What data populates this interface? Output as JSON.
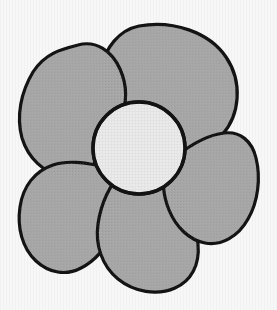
{
  "image": {
    "title": "Five-petal flower line drawing",
    "subject": "flower",
    "style": "hand-drawn black outline with flat gray fill",
    "width": 277,
    "height": 310,
    "background_color": "#f7f7f7",
    "outline_color": "#131313",
    "petal_fill_color": "#a6a6a6",
    "center_fill_color": "#ebebeb"
  },
  "flower": {
    "petal_count": 5,
    "bounds": {
      "left": 18,
      "top": 23,
      "right": 258,
      "bottom": 292
    },
    "center": {
      "name": "flower-center-disc",
      "cx": 139,
      "cy": 148,
      "r": 46,
      "fill": "#ebebeb",
      "texture": "fine-grid"
    },
    "petals": [
      {
        "name": "petal-top",
        "position": "top",
        "fill": "#a6a6a6",
        "path": "M 139 26 C 173 20 209 32 226 57 C 243 82 240 115 222 135 C 206 153 181 160 162 155 C 150 152 143 143 140 132 C 137 119 129 110 115 104 C 102 98 98 84 101 69 C 105 48 119 30 139 26 Z"
      },
      {
        "name": "petal-upper-left",
        "position": "upper-left",
        "fill": "#a6a6a6",
        "path": "M 78 45 C 96 40 112 51 120 69 C 128 87 127 104 120 120 C 113 136 104 150 96 161 C 88 172 76 178 62 176 C 44 173 28 158 22 138 C 16 116 21 92 33 72 C 45 53 62 49 78 45 Z"
      },
      {
        "name": "petal-lower-left",
        "position": "lower-left",
        "fill": "#a6a6a6",
        "path": "M 96 165 C 108 166 116 174 119 186 C 123 200 121 216 114 231 C 106 248 95 261 81 268 C 66 276 49 273 36 261 C 22 248 17 227 20 207 C 23 186 35 171 53 165 C 68 160 85 163 96 165 Z"
      },
      {
        "name": "petal-bottom",
        "position": "bottom",
        "fill": "#a6a6a6",
        "path": "M 140 166 C 153 164 166 172 176 186 C 188 202 196 223 198 244 C 200 265 191 281 175 288 C 157 296 134 292 118 279 C 102 266 95 245 98 224 C 101 203 110 184 122 173 C 128 168 134 167 140 166 Z"
      },
      {
        "name": "petal-right",
        "position": "right",
        "fill": "#a6a6a6",
        "path": "M 178 155 C 192 144 208 135 224 133 C 240 131 252 141 256 158 C 261 178 258 202 248 219 C 238 237 221 246 205 243 C 189 240 176 227 169 210 C 163 195 162 180 166 168 C 169 161 173 158 178 155 Z"
      }
    ]
  }
}
